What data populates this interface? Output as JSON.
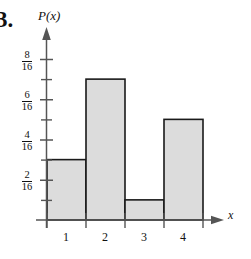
{
  "problem": {
    "number": "3."
  },
  "axes": {
    "y_axis_label": "P(x)",
    "x_axis_label": "x",
    "y_tick_labels": [
      {
        "numerator": "8",
        "denominator": "16",
        "value": 0.5
      },
      {
        "numerator": "6",
        "denominator": "16",
        "value": 0.375
      },
      {
        "numerator": "4",
        "denominator": "16",
        "value": 0.25
      },
      {
        "numerator": "2",
        "denominator": "16",
        "value": 0.125
      }
    ],
    "x_tick_labels": [
      "1",
      "2",
      "3",
      "4"
    ]
  },
  "colors": {
    "bar_fill": "#dcdcdc",
    "bar_stroke": "#1a1a1a",
    "axis": "#555555",
    "text": "#111111"
  },
  "chart_data": {
    "type": "bar",
    "title": "",
    "xlabel": "x",
    "ylabel": "P(x)",
    "categories": [
      "1",
      "2",
      "3",
      "4"
    ],
    "values": [
      0.1875,
      0.4375,
      0.0625,
      0.3125
    ],
    "value_fractions": [
      "3/16",
      "7/16",
      "1/16",
      "5/16"
    ],
    "ylim": [
      0,
      0.5625
    ],
    "ytick_values": [
      0.125,
      0.25,
      0.375,
      0.5
    ],
    "ytick_text": [
      "2/16",
      "4/16",
      "6/16",
      "8/16"
    ],
    "minor_tick_step": 0.0625,
    "grid": false,
    "legend": false
  }
}
